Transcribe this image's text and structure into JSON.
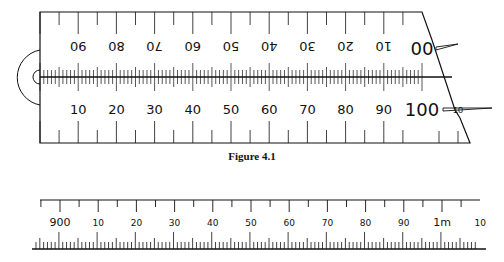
{
  "figure1": {
    "caption": "Figure 4.1",
    "top_scale_labels": [
      "90",
      "80",
      "70",
      "60",
      "50",
      "40",
      "30",
      "20",
      "10",
      "0"
    ],
    "bottom_scale_labels": [
      "10",
      "20",
      "30",
      "40",
      "50",
      "60",
      "70",
      "80",
      "90",
      "100"
    ],
    "cursor_label": "10",
    "ink_color": "#111111"
  },
  "figure2": {
    "labels": [
      "900",
      "10",
      "20",
      "30",
      "40",
      "50",
      "60",
      "70",
      "80",
      "90",
      "1m",
      "10"
    ]
  }
}
